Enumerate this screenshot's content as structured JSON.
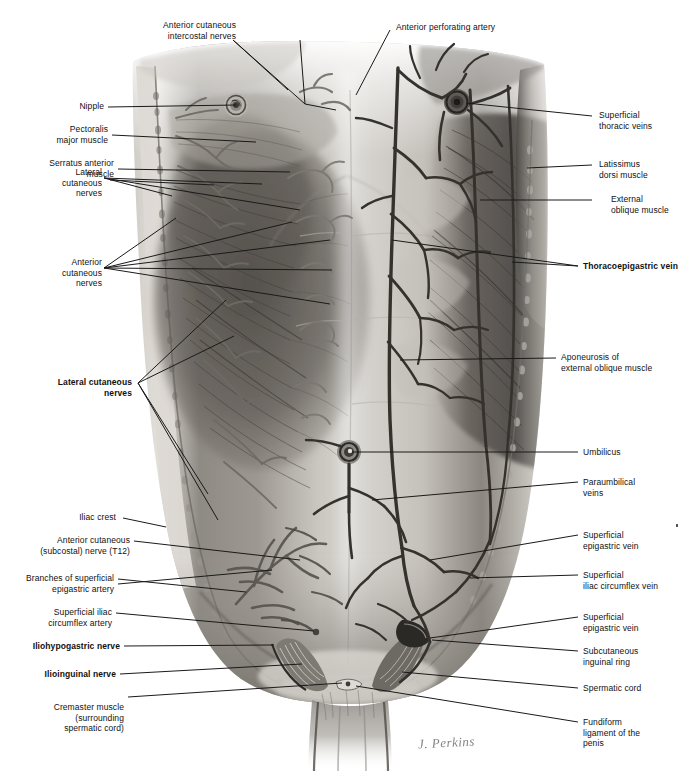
{
  "figure": {
    "signature": "J. Perkins",
    "medium": "grayscale pencil anatomical illustration",
    "view": "anterior view of male trunk, skin and superficial fascia reflected"
  },
  "colors": {
    "background": "#ffffff",
    "label_text": "#111111",
    "leader_line": "#1a1a1a",
    "skin_light": "#d9d6d1",
    "skin_mid": "#b3afa9",
    "muscle_dark": "#6d6963",
    "muscle_darkest": "#3d3a36",
    "vessel": "#4a4641",
    "signature": "#6f6f6f"
  },
  "labels_top": [
    {
      "id": "anterior-cutaneous-intercostal-nerves",
      "text": "Anterior cutaneous\nintercostal nerves",
      "bold": false
    },
    {
      "id": "anterior-perforating-artery",
      "text": "Anterior perforating artery",
      "bold": false
    }
  ],
  "labels_left": [
    {
      "id": "nipple",
      "text": "Nipple",
      "bold": false
    },
    {
      "id": "pectoralis-major-muscle",
      "text": "Pectoralis\nmajor muscle",
      "bold": false
    },
    {
      "id": "serratus-anterior-muscle",
      "text": "Serratus anterior\nmuscle",
      "bold": false
    },
    {
      "id": "lateral-cutaneous-nerves-upper",
      "text": "Lateral\ncutaneous\nnerves",
      "bold": false
    },
    {
      "id": "anterior-cutaneous-nerves",
      "text": "Anterior\ncutaneous\nnerves",
      "bold": false
    },
    {
      "id": "lateral-cutaneous-nerves-lower",
      "text": "Lateral cutaneous\nnerves",
      "bold": true
    },
    {
      "id": "iliac-crest",
      "text": "Iliac crest",
      "bold": false
    },
    {
      "id": "anterior-cutaneous-subcostal-nerve-t12",
      "text": "Anterior cutaneous\n(subcostal) nerve (T12)",
      "bold": false
    },
    {
      "id": "branches-of-superficial-epigastric-artery",
      "text": "Branches of superficial\nepigastric artery",
      "bold": false
    },
    {
      "id": "superficial-iliac-circumflex-artery",
      "text": "Superficial iliac\ncircumflex artery",
      "bold": false
    },
    {
      "id": "iliohypogastric-nerve",
      "text": "Iliohypogastric nerve",
      "bold": true
    },
    {
      "id": "ilioinguinal-nerve",
      "text": "Ilioinguinal nerve",
      "bold": true
    },
    {
      "id": "cremaster-muscle",
      "text": "Cremaster muscle\n(surrounding\nspermatic cord)",
      "bold": false
    }
  ],
  "labels_right": [
    {
      "id": "superficial-thoracic-veins",
      "text": "Superficial\nthoracic veins",
      "bold": false
    },
    {
      "id": "latissimus-dorsi-muscle",
      "text": "Latissimus\ndorsi muscle",
      "bold": false
    },
    {
      "id": "external-oblique-muscle",
      "text": "External\noblique muscle",
      "bold": false
    },
    {
      "id": "thoracoepigastric-vein",
      "text": "Thoracoepigastric vein",
      "bold": true
    },
    {
      "id": "aponeurosis-of-external-oblique-muscle",
      "text": "Aponeurosis of\nexternal oblique muscle",
      "bold": false
    },
    {
      "id": "umbilicus",
      "text": "Umbilicus",
      "bold": false
    },
    {
      "id": "paraumbilical-veins",
      "text": "Paraumbilical\nveins",
      "bold": false
    },
    {
      "id": "superficial-epigastric-vein-upper",
      "text": "Superficial\nepigastric vein",
      "bold": false
    },
    {
      "id": "superficial-iliac-circumflex-vein",
      "text": "Superficial\niliac circumflex vein",
      "bold": false
    },
    {
      "id": "superficial-epigastric-vein-lower",
      "text": "Superficial\nepigastric vein",
      "bold": false
    },
    {
      "id": "subcutaneous-inguinal-ring",
      "text": "Subcutaneous\ninguinal ring",
      "bold": false
    },
    {
      "id": "spermatic-cord",
      "text": "Spermatic cord",
      "bold": false
    },
    {
      "id": "fundiform-ligament-of-the-penis",
      "text": "Fundiform\nligament of the\npenis",
      "bold": false
    }
  ]
}
